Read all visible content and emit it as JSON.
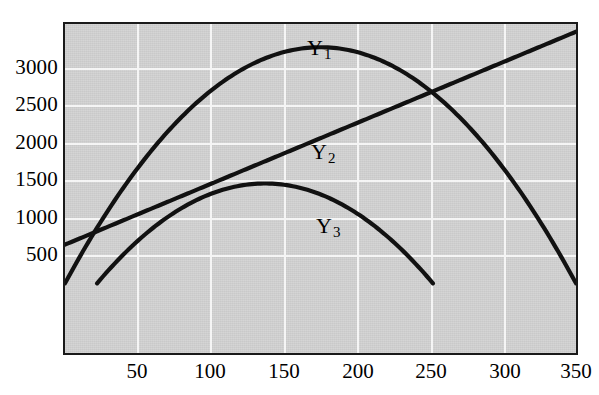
{
  "chart_data": {
    "type": "line",
    "title": "",
    "subtitle": "",
    "xlabel": "",
    "ylabel": "",
    "xlim": [
      0,
      350
    ],
    "ylim": [
      -900,
      3350
    ],
    "grid": true,
    "legend_position": "inline-annotation",
    "background_color": "#c9c9c9",
    "gridline_color": "#f4f4f4",
    "curve_color": "#111111",
    "frame_color": "#1a1a1a",
    "x_ticks": [
      50,
      100,
      150,
      200,
      250,
      300,
      350
    ],
    "x_tick_labels": [
      "50",
      "100",
      "150",
      "200",
      "250",
      "300",
      "350"
    ],
    "y_ticks": [
      500,
      1000,
      1500,
      2000,
      2500,
      3000
    ],
    "y_tick_labels": [
      "500",
      "1000",
      "1500",
      "2000",
      "2500",
      "3000"
    ],
    "series": [
      {
        "name": "Y1",
        "label": "Y",
        "subscript": "1",
        "shape": "parabola",
        "label_x": 178,
        "label_y": 3300,
        "description": "Downward parabola, zero at x=0 and x=350, peak 3050 at x=175",
        "peak": {
          "x": 175,
          "y": 3050
        },
        "roots": [
          0,
          350
        ],
        "points": [
          {
            "x": 0,
            "y": 0
          },
          {
            "x": 25,
            "y": 763
          },
          {
            "x": 50,
            "y": 1394
          },
          {
            "x": 75,
            "y": 1894
          },
          {
            "x": 100,
            "y": 2263
          },
          {
            "x": 125,
            "y": 2501
          },
          {
            "x": 150,
            "y": 2606
          },
          {
            "x": 175,
            "y": 3050
          },
          {
            "x": 200,
            "y": 2991
          },
          {
            "x": 225,
            "y": 2806
          },
          {
            "x": 250,
            "y": 2501
          },
          {
            "x": 275,
            "y": 2040
          },
          {
            "x": 300,
            "y": 1463
          },
          {
            "x": 325,
            "y": 763
          },
          {
            "x": 350,
            "y": 0
          }
        ]
      },
      {
        "name": "Y2",
        "label": "Y",
        "subscript": "2",
        "shape": "line",
        "label_x": 172,
        "label_y": 2230,
        "description": "Straight line from 500 at x=0 to 3250 at x=350",
        "intercept": 500,
        "slope": 7.857,
        "points": [
          {
            "x": 0,
            "y": 500
          },
          {
            "x": 50,
            "y": 893
          },
          {
            "x": 100,
            "y": 1286
          },
          {
            "x": 150,
            "y": 1679
          },
          {
            "x": 200,
            "y": 2071
          },
          {
            "x": 250,
            "y": 2464
          },
          {
            "x": 300,
            "y": 2857
          },
          {
            "x": 350,
            "y": 3250
          }
        ]
      },
      {
        "name": "Y3",
        "label": "Y",
        "subscript": "3",
        "shape": "parabola",
        "label_x": 182,
        "label_y": 1430,
        "description": "Downward parabola, zero at x=22 and x=252, peak 1290 at x=137",
        "peak": {
          "x": 137,
          "y": 1290
        },
        "roots": [
          22,
          252
        ],
        "points": [
          {
            "x": 22,
            "y": 0
          },
          {
            "x": 40,
            "y": 353
          },
          {
            "x": 60,
            "y": 672
          },
          {
            "x": 80,
            "y": 925
          },
          {
            "x": 100,
            "y": 1113
          },
          {
            "x": 120,
            "y": 1236
          },
          {
            "x": 137,
            "y": 1290
          },
          {
            "x": 160,
            "y": 1261
          },
          {
            "x": 180,
            "y": 1178
          },
          {
            "x": 200,
            "y": 1029
          },
          {
            "x": 220,
            "y": 815
          },
          {
            "x": 240,
            "y": 337
          },
          {
            "x": 252,
            "y": 0
          }
        ]
      }
    ],
    "annotations": [
      {
        "text": "Y1",
        "x": 178,
        "y": 3300
      },
      {
        "text": "Y2",
        "x": 172,
        "y": 2230
      },
      {
        "text": "Y3",
        "x": 182,
        "y": 1430
      }
    ],
    "intersections": [
      {
        "series": [
          "Y1",
          "Y2"
        ],
        "x": 255,
        "y": 2440
      }
    ]
  }
}
